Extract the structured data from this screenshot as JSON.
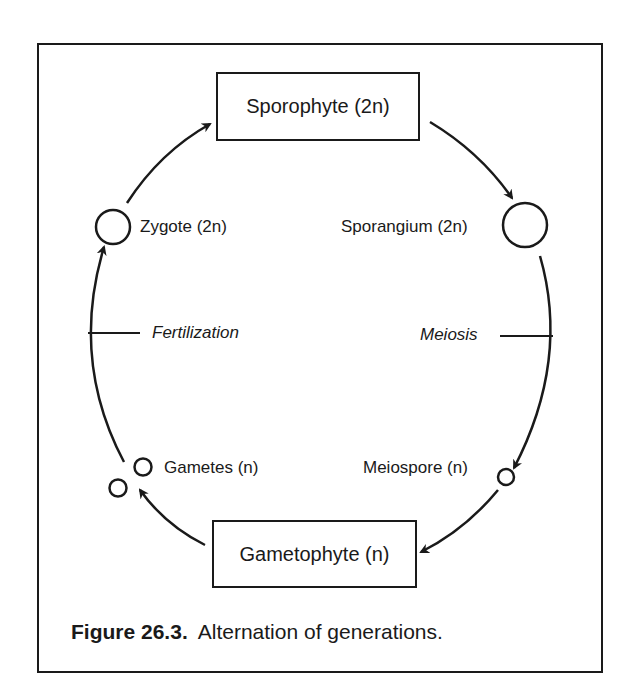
{
  "diagram": {
    "stages": {
      "sporophyte": "Sporophyte (2n)",
      "gametophyte": "Gametophyte (n)"
    },
    "structures": {
      "zygote": "Zygote (2n)",
      "sporangium": "Sporangium (2n)",
      "meiospore": "Meiospore (n)",
      "gametes": "Gametes (n)"
    },
    "processes": {
      "fertilization": "Fertilization",
      "meiosis": "Meiosis"
    },
    "colors": {
      "stroke": "#1a1a1a",
      "background": "#ffffff"
    }
  },
  "caption": {
    "number": "Figure 26.3.",
    "text": "Alternation of generations."
  }
}
